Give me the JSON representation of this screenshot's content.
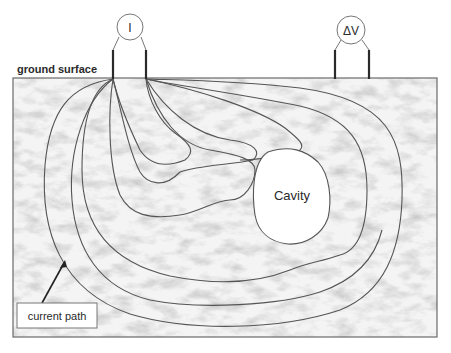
{
  "diagram": {
    "ground_label": "ground surface",
    "current_meter_label": "I",
    "voltage_meter_label": "ΔV",
    "cavity_label": "Cavity",
    "callout_label": "current path",
    "colors": {
      "line": "#555555",
      "electrode": "#2a2a2a",
      "ground_fill": "#e9e9e9",
      "cavity_fill": "#ffffff",
      "border": "#6a6a6a"
    }
  }
}
